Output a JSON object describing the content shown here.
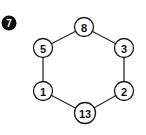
{
  "badge": {
    "label": "7",
    "cx": 9,
    "cy": 23,
    "r": 7.5,
    "color": "#0a0a0a",
    "text_color": "#ffffff"
  },
  "diagram": {
    "type": "hexagonal-cycle-graph",
    "nodes": [
      {
        "id": "top",
        "label": "8",
        "cx": 84,
        "cy": 27,
        "r": 9.5
      },
      {
        "id": "upper-right",
        "label": "3",
        "cx": 124,
        "cy": 48,
        "r": 9.5
      },
      {
        "id": "lower-right",
        "label": "2",
        "cx": 124,
        "cy": 91,
        "r": 9.5
      },
      {
        "id": "bottom",
        "label": "13",
        "cx": 85,
        "cy": 113,
        "r": 10.5
      },
      {
        "id": "lower-left",
        "label": "1",
        "cx": 43,
        "cy": 91,
        "r": 9.5
      },
      {
        "id": "upper-left",
        "label": "5",
        "cx": 43,
        "cy": 48,
        "r": 9.5
      }
    ],
    "edges": [
      [
        "top",
        "upper-right"
      ],
      [
        "upper-right",
        "lower-right"
      ],
      [
        "lower-right",
        "bottom"
      ],
      [
        "bottom",
        "lower-left"
      ],
      [
        "lower-left",
        "upper-left"
      ],
      [
        "upper-left",
        "top"
      ]
    ]
  }
}
